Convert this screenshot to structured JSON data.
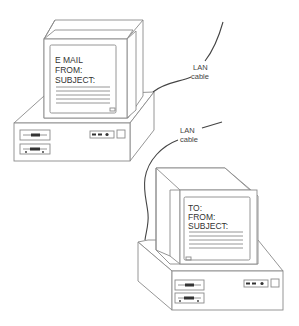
{
  "diagram": {
    "type": "network-illustration",
    "computers": [
      {
        "id": "sender",
        "screen_lines": [
          "E MAIL",
          "FROM:",
          "SUBJECT:"
        ],
        "text_rule_count": 5
      },
      {
        "id": "receiver",
        "screen_lines": [
          "TO:",
          "FROM:",
          "SUBJECT:"
        ],
        "text_rule_count": 5
      }
    ],
    "labels": [
      {
        "id": "lan-label-top",
        "line1": "LAN",
        "line2": "cable"
      },
      {
        "id": "lan-label-bottom",
        "line1": "LAN",
        "line2": "cable"
      }
    ],
    "colors": {
      "line": "#8a8a8a",
      "cable": "#444444",
      "text": "#333333",
      "background": "#ffffff"
    }
  }
}
